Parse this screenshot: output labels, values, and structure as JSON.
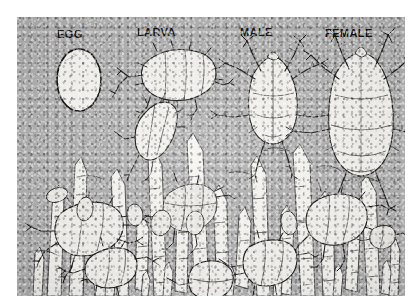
{
  "figure": {
    "media": "halftone print photograph",
    "plate_background_color": "#b2b2b2",
    "ink_color": "#1b1b1b",
    "page_background_color": "#ffffff"
  },
  "labels": [
    {
      "id": "egg",
      "text": "EGG",
      "x": 57,
      "y": 28
    },
    {
      "id": "larva",
      "text": "LARVA",
      "x": 137,
      "y": 26
    },
    {
      "id": "male",
      "text": "MALE",
      "x": 240,
      "y": 26
    },
    {
      "id": "female",
      "text": "FEMALE",
      "x": 325,
      "y": 27
    }
  ],
  "specimens": {
    "egg": {
      "name": "egg",
      "description": "smooth oval ovum, dark outline, pale interior"
    },
    "larva": {
      "name": "larva",
      "description": "plump six-legged larva with dorsal bristles"
    },
    "male": {
      "name": "adult male",
      "description": "adult male mite, eight legs splayed, suckers on fore legs"
    },
    "female": {
      "name": "adult female",
      "description": "adult female mite, larger rounded body, eight legs"
    }
  },
  "habitat": {
    "name": "skin-surface habitat",
    "description": "mites and eggs among tapering hair shafts on skin",
    "hair_count": 27,
    "mite_count": 8,
    "loose_egg_count": 5
  }
}
